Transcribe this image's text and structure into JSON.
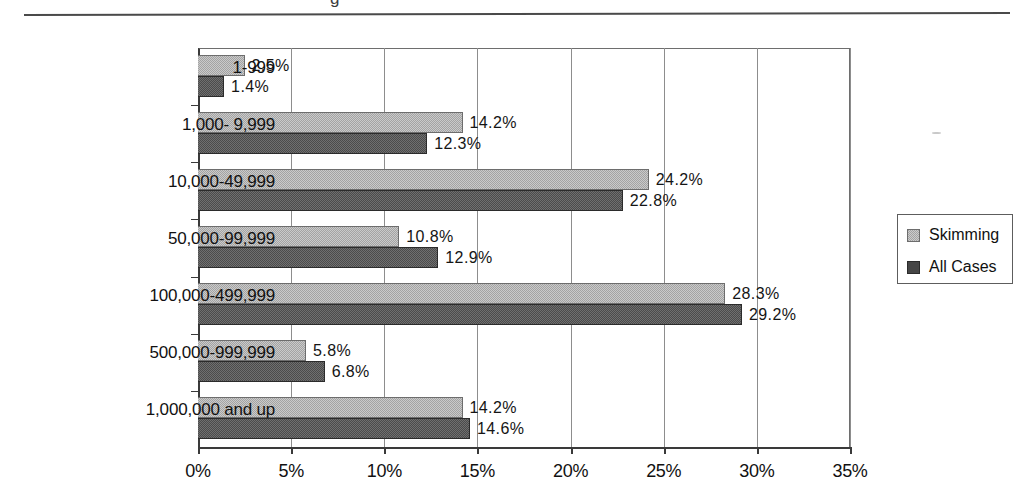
{
  "page": {
    "title_fragment": "g",
    "stray_mark": "scan-speck"
  },
  "legend": {
    "position": "right",
    "items": [
      {
        "label": "Skimming",
        "color": "#a3a3a3",
        "key": "skimming"
      },
      {
        "label": "All Cases",
        "color": "#464646",
        "key": "allcases"
      }
    ]
  },
  "axis": {
    "x_ticks": [
      "0%",
      "5%",
      "10%",
      "15%",
      "20%",
      "25%",
      "30%",
      "35%"
    ],
    "x_values": [
      0,
      5,
      10,
      15,
      20,
      25,
      30,
      35
    ]
  },
  "chart_data": {
    "type": "bar",
    "orientation": "horizontal",
    "title": "",
    "xlabel": "",
    "ylabel": "",
    "xlim": [
      0,
      35
    ],
    "grid": true,
    "legend_position": "right",
    "categories": [
      "1-999",
      "1,000- 9,999",
      "10,000-49,999",
      "50,000-99,999",
      "100,000-499,999",
      "500,000-999,999",
      "1,000,000 and up"
    ],
    "series": [
      {
        "name": "Skimming",
        "color": "#a3a3a3",
        "values": [
          2.5,
          14.2,
          24.2,
          10.8,
          28.3,
          5.8,
          14.2
        ],
        "labels": [
          "2.5%",
          "14.2%",
          "24.2%",
          "10.8%",
          "28.3%",
          "5.8%",
          "14.2%"
        ]
      },
      {
        "name": "All Cases",
        "color": "#464646",
        "values": [
          1.4,
          12.3,
          22.8,
          12.9,
          29.2,
          6.8,
          14.6
        ],
        "labels": [
          "1.4%",
          "12.3%",
          "22.8%",
          "12.9%",
          "29.2%",
          "6.8%",
          "14.6%"
        ]
      }
    ]
  }
}
